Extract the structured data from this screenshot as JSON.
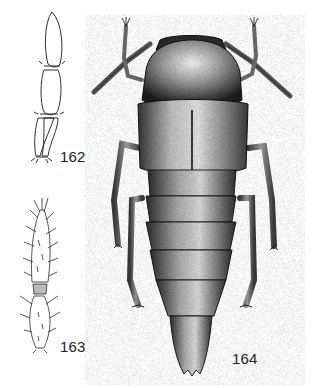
{
  "plate": {
    "background": "#ffffff",
    "ink_color": "#1a1a1a",
    "figures": [
      {
        "id": "fig162",
        "label": "162",
        "subject": "antenna segments (outline, enlarged)",
        "label_pos": [
          60,
          148
        ]
      },
      {
        "id": "fig163",
        "label": "163",
        "subject": "antenna segments (setose, enlarged)",
        "label_pos": [
          60,
          338
        ]
      },
      {
        "id": "fig164",
        "label": "164",
        "subject": "rove beetle, dorsal habitus (stippled)",
        "label_pos": [
          232,
          350
        ]
      }
    ]
  }
}
